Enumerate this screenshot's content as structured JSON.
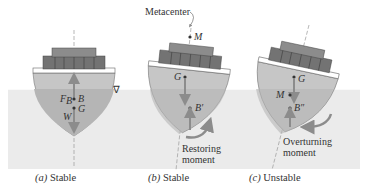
{
  "figure": {
    "water_symbol": "∇",
    "panels": [
      {
        "id": "a",
        "caption_letter": "(a)",
        "caption_text": " Stable",
        "labels": {
          "buoyancy": "F",
          "buoyancy_sub": "B",
          "center_buoyancy": "B",
          "center_gravity": "G",
          "weight": "W"
        }
      },
      {
        "id": "b",
        "caption_letter": "(b)",
        "caption_text": " Stable",
        "labels": {
          "metacenter_title": "Metacenter",
          "metacenter": "M",
          "center_gravity": "G",
          "center_buoyancy": "B′",
          "moment_line1": "Restoring",
          "moment_line2": "moment"
        }
      },
      {
        "id": "c",
        "caption_letter": "(c)",
        "caption_text": " Unstable",
        "labels": {
          "center_gravity": "G",
          "metacenter": "M",
          "center_buoyancy": "B″",
          "moment_line1": "Overturning",
          "moment_line2": "moment"
        }
      }
    ],
    "colors": {
      "water": "#ebebeb",
      "hull": "#c9c9c9",
      "hull_below": "#b8b8b8",
      "deck_top": "#8a8a8a",
      "deck_mid": "#6f6f6f",
      "arrow": "#8c8c8c"
    }
  }
}
